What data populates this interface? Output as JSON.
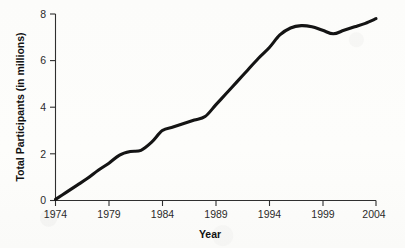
{
  "chart_data": {
    "type": "line",
    "title": "",
    "xlabel": "Year",
    "ylabel": "Total Participants (in millions)",
    "xlim": [
      1974,
      2004
    ],
    "ylim": [
      0,
      8
    ],
    "xticks": [
      1974,
      1979,
      1984,
      1989,
      1994,
      1999,
      2004
    ],
    "xtick_labels": [
      "1974",
      "1979",
      "1984",
      "1989",
      "1994",
      "1999",
      "2004"
    ],
    "yticks": [
      0,
      2,
      4,
      6,
      8
    ],
    "ytick_labels": [
      "0",
      "2",
      "4",
      "6",
      "8"
    ],
    "grid": false,
    "legend": false,
    "line_color": "#141414",
    "series": [
      {
        "name": "Total Participants",
        "x": [
          1974,
          1975,
          1976,
          1977,
          1978,
          1979,
          1980,
          1981,
          1982,
          1983,
          1984,
          1985,
          1986,
          1987,
          1988,
          1989,
          1990,
          1991,
          1992,
          1993,
          1994,
          1995,
          1996,
          1997,
          1998,
          1999,
          2000,
          2001,
          2002,
          2003,
          2004
        ],
        "values": [
          0.05,
          0.35,
          0.65,
          0.95,
          1.3,
          1.6,
          1.95,
          2.1,
          2.15,
          2.5,
          3.0,
          3.15,
          3.3,
          3.45,
          3.6,
          4.1,
          4.6,
          5.1,
          5.6,
          6.1,
          6.55,
          7.1,
          7.4,
          7.5,
          7.45,
          7.3,
          7.15,
          7.3,
          7.45,
          7.6,
          7.8
        ]
      }
    ]
  },
  "axis": {
    "x_title": "Year",
    "y_title": "Total Participants (in millions)"
  }
}
